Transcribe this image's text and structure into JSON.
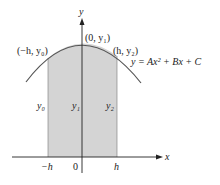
{
  "figure": {
    "type": "parabola-area-diagram",
    "colors": {
      "shade": "#d4d4d4",
      "curve": "#555555",
      "axis": "#222222"
    },
    "axes": {
      "x_label": "x",
      "y_label": "y"
    },
    "ticks": {
      "neg_h": "−h",
      "zero": "0",
      "h": "h"
    },
    "points": {
      "left": "(−h, y₀)",
      "middle": "(0, y₁)",
      "right": "(h, y₂)"
    },
    "ordinates": {
      "y0": "y₀",
      "y1": "y₁",
      "y2": "y₂"
    },
    "equation": "y = Ax² + Bx + C"
  }
}
